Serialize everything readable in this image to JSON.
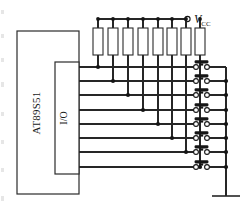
{
  "diagram": {
    "type": "schematic"
  },
  "chip": {
    "label": "AT89S51",
    "port_label": "I/O",
    "orientation": "vertical-text"
  },
  "power": {
    "label": "V",
    "subscript": "CC",
    "terminal": "open-circle"
  },
  "resistors": {
    "count": 8,
    "symbol": "rectangle-box",
    "role": "pull-up"
  },
  "switches": {
    "count": 8,
    "symbol": "push-button-normally-open",
    "items": [
      {
        "name": "switch-1"
      },
      {
        "name": "switch-2"
      },
      {
        "name": "switch-3"
      },
      {
        "name": "switch-4"
      },
      {
        "name": "switch-5"
      },
      {
        "name": "switch-6"
      },
      {
        "name": "switch-7"
      },
      {
        "name": "switch-8"
      }
    ]
  },
  "ground": {
    "symbol": "earth-bar"
  },
  "colors": {
    "wire": "#262626",
    "outline": "#2b2b2b",
    "junction": "#151515",
    "background": "#ffffff"
  },
  "geometry": {
    "chip_box": {
      "x": 17,
      "y": 31,
      "w": 62,
      "h": 163
    },
    "io_box": {
      "x": 55,
      "y": 62,
      "w": 24,
      "h": 112
    },
    "top_rail_y": 19,
    "vcc_x": 188,
    "right_bus_x": 226,
    "resistor_xs": [
      98,
      113,
      128,
      143,
      158,
      172,
      186,
      200
    ],
    "row_ys": [
      67,
      81,
      95,
      110,
      124,
      138,
      152,
      167
    ],
    "switch_x": 196,
    "ground_y": 196
  }
}
